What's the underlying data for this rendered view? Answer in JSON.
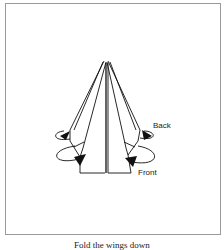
{
  "figure": {
    "labels": {
      "back": "Back",
      "front": "Front"
    },
    "caption": "Fold the wings down"
  }
}
